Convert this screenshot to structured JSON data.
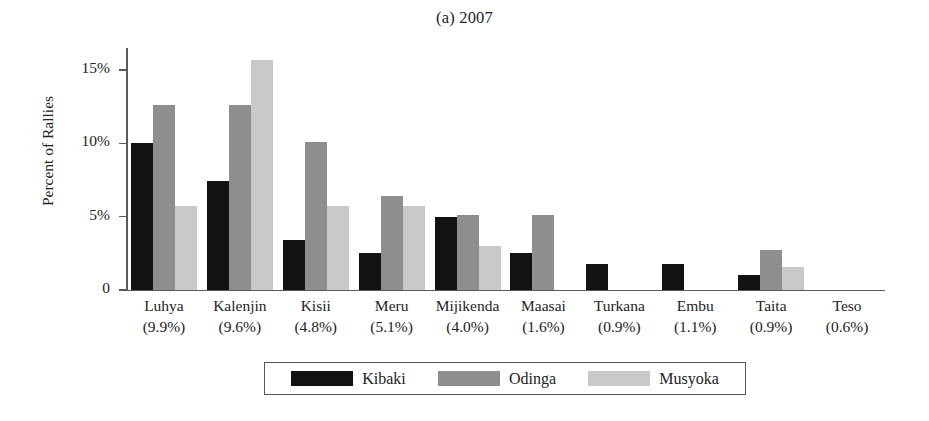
{
  "chart_data": {
    "type": "bar",
    "title": "(a) 2007",
    "xlabel": "",
    "ylabel": "Percent of Rallies",
    "ylim": [
      0,
      16.5
    ],
    "yticks": [
      0,
      5,
      10,
      15
    ],
    "ytick_labels": [
      "0",
      "5%",
      "10%",
      "15%"
    ],
    "grid": false,
    "legend_position": "bottom-center",
    "categories": [
      "Luhya",
      "Kalenjin",
      "Kisii",
      "Meru",
      "Mijikenda",
      "Maasai",
      "Turkana",
      "Embu",
      "Taita",
      "Teso"
    ],
    "category_shares": [
      "(9.9%)",
      "(9.6%)",
      "(4.8%)",
      "(5.1%)",
      "(4.0%)",
      "(1.6%)",
      "(0.9%)",
      "(1.1%)",
      "(0.9%)",
      "(0.6%)"
    ],
    "series": [
      {
        "name": "Kibaki",
        "color": "#121212",
        "values": [
          10.0,
          7.4,
          3.4,
          2.5,
          5.0,
          2.5,
          1.8,
          1.8,
          1.0,
          0.0
        ]
      },
      {
        "name": "Odinga",
        "color": "#8e8e8e",
        "values": [
          12.6,
          12.6,
          10.1,
          6.4,
          5.1,
          5.1,
          0.0,
          0.0,
          2.7,
          0.0
        ]
      },
      {
        "name": "Musyoka",
        "color": "#c9c9c9",
        "values": [
          5.7,
          15.7,
          5.7,
          5.7,
          3.0,
          0.0,
          0.0,
          0.0,
          1.6,
          0.0
        ]
      }
    ]
  }
}
